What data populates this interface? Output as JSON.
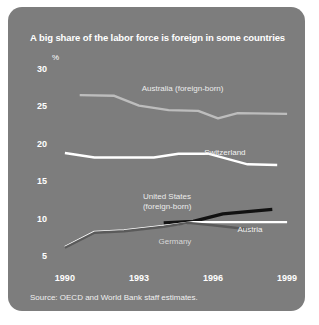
{
  "chart_data": {
    "type": "line",
    "title": "A big share of the labor force is foreign in some countries",
    "subtitle": "",
    "xlabel": "",
    "ylabel": "%",
    "unit_label": "%",
    "source": "Source: OECD and World Bank staff estimates.",
    "xlim": [
      1989.6,
      1999.4
    ],
    "ylim": [
      4.0,
      31.0
    ],
    "yticks": [
      5,
      10,
      15,
      20,
      25,
      30
    ],
    "ytick_labels": [
      "5",
      "10",
      "15",
      "20",
      "25",
      "30"
    ],
    "xticks": [
      1990,
      1993,
      1996,
      1999
    ],
    "xtick_labels": [
      "1990",
      "1993",
      "1996",
      "1999"
    ],
    "grid": false,
    "legend_position": "inline-annotations",
    "background_color": "#7d7d7d",
    "series": [
      {
        "name": "Australia (foreign-born)",
        "color": "#bdbdbd",
        "label_x": 1995.2,
        "label_y": 27.4,
        "x": [
          1990.6,
          1992.0,
          1993.0,
          1994.2,
          1995.4,
          1996.2,
          1997.0,
          1999.0
        ],
        "values": [
          26.6,
          26.5,
          25.2,
          24.6,
          24.5,
          23.5,
          24.2,
          24.1
        ]
      },
      {
        "name": "Switzerland",
        "color": "#ffffff",
        "label_x": 1996.6,
        "label_y": 18.9,
        "x": [
          1990.0,
          1991.2,
          1993.6,
          1994.6,
          1995.8,
          1997.4,
          1998.6
        ],
        "values": [
          18.9,
          18.3,
          18.3,
          18.8,
          18.8,
          17.4,
          17.3
        ]
      },
      {
        "name": "United States (foreign-born)",
        "color": "#111111",
        "label_x": 1995.6,
        "label_y": 13.0,
        "x": [
          1994.0,
          1995.2,
          1996.4,
          1998.4
        ],
        "values": [
          9.6,
          9.8,
          10.8,
          11.4
        ]
      },
      {
        "name": "Austria",
        "color": "#ffffff",
        "label_x": 1997.6,
        "label_y": 8.6,
        "x": [
          1990.0,
          1991.2,
          1992.4,
          1994.0,
          1995.2,
          1999.0
        ],
        "values": [
          6.4,
          8.4,
          8.6,
          9.2,
          9.7,
          9.7
        ]
      },
      {
        "name": "Germany",
        "color": "#5a5a5a",
        "label_x": 1994.4,
        "label_y": 7.1,
        "x": [
          1990.0,
          1991.2,
          1992.4,
          1994.0,
          1995.0,
          1996.0,
          1997.6
        ],
        "values": [
          6.3,
          8.3,
          8.5,
          9.1,
          9.6,
          9.3,
          8.7
        ]
      }
    ]
  }
}
